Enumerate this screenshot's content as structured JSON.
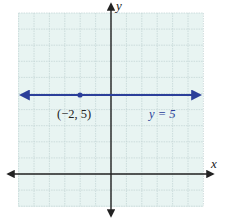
{
  "chart_data": {
    "type": "line",
    "title": "",
    "xlabel": "x",
    "ylabel": "y",
    "xlim": [
      -6,
      6
    ],
    "ylim": [
      -2,
      10
    ],
    "grid": true,
    "series": [
      {
        "name": "y = 5",
        "equation": "y = 5",
        "x": [
          -6,
          6
        ],
        "y": [
          5,
          5
        ],
        "color": "#2b3f9a",
        "arrows": "both"
      }
    ],
    "points": [
      {
        "x": -2,
        "y": 5,
        "label": "(−2, 5)"
      }
    ],
    "annotations": [
      {
        "text": "(−2, 5)",
        "x": -2,
        "y": 3.8
      },
      {
        "text": "y = 5",
        "x": 3.2,
        "y": 3.8
      }
    ]
  },
  "labels": {
    "x_axis": "x",
    "y_axis": "y",
    "point": "(−2, 5)",
    "line": "y = 5"
  },
  "colors": {
    "grid_bg": "#e8f4f2",
    "grid_line": "#c4d6d6",
    "axis": "#222222",
    "line": "#2b3f9a"
  }
}
